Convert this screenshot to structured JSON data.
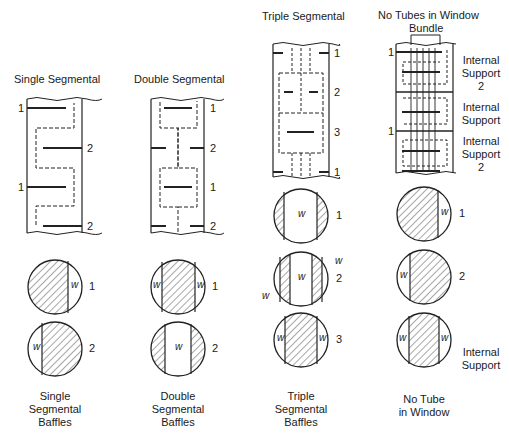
{
  "columns": [
    {
      "title": "Single Segmental",
      "caption": [
        "Single",
        "Segmental",
        "Baffles"
      ],
      "side_labels": [
        "1",
        "2",
        "1",
        "2"
      ],
      "circle_labels": [
        "1",
        "2"
      ]
    },
    {
      "title": "Double Segmental",
      "caption": [
        "Double",
        "Segmental",
        "Baffles"
      ],
      "side_labels": [
        "1",
        "2",
        "1",
        "2"
      ],
      "circle_labels": [
        "1",
        "2"
      ]
    },
    {
      "title": "Triple Segmental",
      "caption": [
        "Triple",
        "Segmental",
        "Baffles"
      ],
      "side_labels": [
        "1",
        "2",
        "3",
        "1"
      ],
      "circle_labels": [
        "1",
        "2",
        "3"
      ]
    },
    {
      "title": "No Tubes in Window",
      "subtitle": "Bundle",
      "caption": [
        "No Tube",
        "in Window"
      ],
      "left_labels": [
        "1",
        "1"
      ],
      "right_labels": [
        [
          "Internal",
          "Support",
          "2"
        ],
        [
          "Internal",
          "Support"
        ],
        [
          "Internal",
          "Support",
          "2"
        ]
      ],
      "circle_labels": [
        "1",
        "2"
      ],
      "bottom_circle_label": [
        "Internal",
        "Support"
      ]
    }
  ],
  "window_label": "w"
}
